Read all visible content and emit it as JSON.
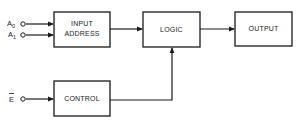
{
  "diagram": {
    "type": "block-diagram",
    "blocks": [
      {
        "id": "input_address",
        "lines": [
          "INPUT",
          "ADDRESS"
        ]
      },
      {
        "id": "logic",
        "lines": [
          "LOGIC"
        ]
      },
      {
        "id": "output",
        "lines": [
          "OUTPUT"
        ]
      },
      {
        "id": "control",
        "lines": [
          "CONTROL"
        ]
      }
    ],
    "inputs": [
      {
        "id": "a0",
        "label": "A",
        "subscript": "0",
        "target": "input_address"
      },
      {
        "id": "a1",
        "label": "A",
        "subscript": "1",
        "target": "input_address"
      },
      {
        "id": "e_bar",
        "label": "E",
        "overline": true,
        "target": "control"
      }
    ],
    "connections": [
      {
        "from": "input_address",
        "to": "logic"
      },
      {
        "from": "logic",
        "to": "output"
      },
      {
        "from": "control",
        "to": "logic"
      }
    ],
    "colors": {
      "stroke": "#1a1a1a",
      "background": "#ffffff"
    }
  }
}
